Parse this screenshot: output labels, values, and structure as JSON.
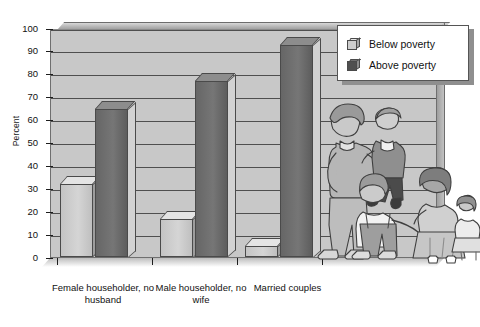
{
  "chart_data": {
    "type": "bar",
    "title": "",
    "xlabel": "",
    "ylabel": "Percent",
    "ylim": [
      0,
      100
    ],
    "ytick_step": 10,
    "yticks": [
      100,
      90,
      80,
      70,
      60,
      50,
      40,
      30,
      20,
      10,
      0
    ],
    "grid": true,
    "legend_position": "top-right",
    "categories": [
      "Female householder, no husband",
      "Male householder, no wife",
      "Married couples"
    ],
    "series": [
      {
        "name": "Below poverty",
        "color": "#cccccc",
        "values": [
          32,
          17,
          5
        ]
      },
      {
        "name": "Above poverty",
        "color": "#6b6b6b",
        "values": [
          65,
          77,
          93
        ]
      }
    ]
  },
  "axis": {
    "y_title": "Percent",
    "tick_labels": [
      "100",
      "90",
      "80",
      "70",
      "60",
      "50",
      "40",
      "30",
      "20",
      "10",
      "0"
    ],
    "category_labels": [
      "Female householder, no husband",
      "Male householder, no wife",
      "Married couples"
    ]
  },
  "legend": {
    "items": [
      {
        "label": "Below poverty",
        "swatch": "cube-light-icon"
      },
      {
        "label": "Above poverty",
        "swatch": "cube-dark-icon"
      }
    ]
  },
  "illustration": {
    "name": "family-illustration",
    "description": "Line drawing of a family: woman holding a baby, a boy in overalls, a girl holding a doll"
  }
}
